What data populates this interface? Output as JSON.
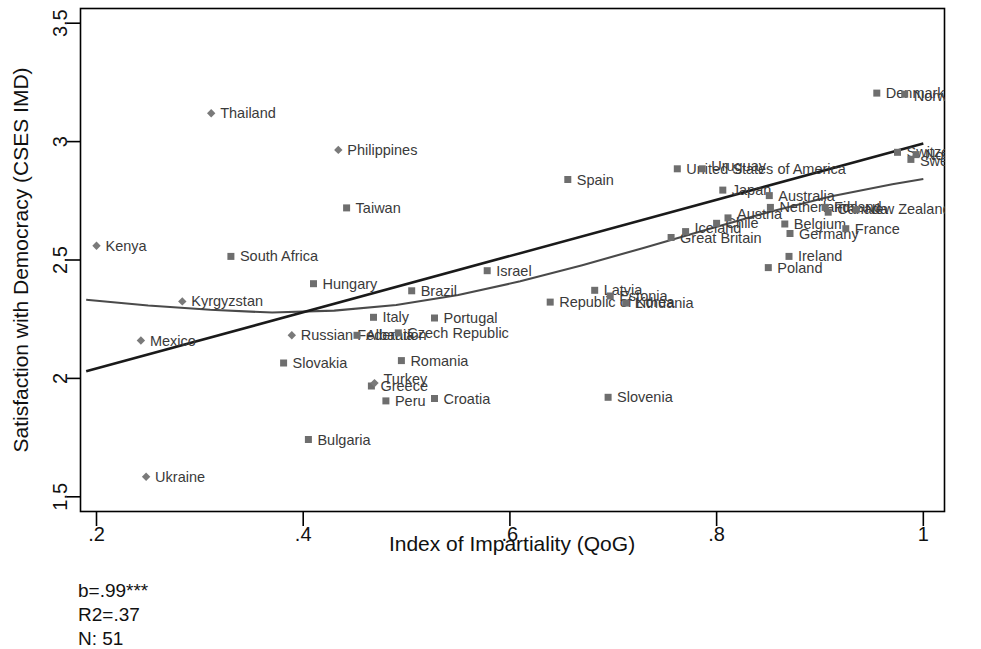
{
  "chart_data": {
    "type": "scatter",
    "title": "",
    "xlabel": "Index of Impartiality (QoG)",
    "ylabel": "Satisfaction with Democracy (CSES IMD)",
    "xlim": [
      0.185,
      1.02
    ],
    "ylim": [
      1.44,
      3.56
    ],
    "xticks": [
      0.2,
      0.4,
      0.6,
      0.8,
      1.0
    ],
    "xticklabels": [
      ".2",
      ".4",
      ".6",
      ".8",
      "1"
    ],
    "yticks": [
      1.5,
      2.0,
      2.5,
      3.0,
      3.5
    ],
    "yticklabels": [
      "1.5",
      "2",
      "2.5",
      "3",
      "3.5"
    ],
    "grid": false,
    "legend": "none",
    "marker_shapes": [
      "square",
      "diamond"
    ],
    "points": [
      {
        "label": "Kenya",
        "x": 0.2,
        "y": 2.56,
        "shape": "diamond",
        "lx": 9,
        "ly": 5
      },
      {
        "label": "Ukraine",
        "x": 0.248,
        "y": 1.585,
        "shape": "diamond",
        "lx": 9,
        "ly": 5
      },
      {
        "label": "Mexico",
        "x": 0.243,
        "y": 2.16,
        "shape": "diamond",
        "lx": 9,
        "ly": 5
      },
      {
        "label": "Kyrgyzstan",
        "x": 0.283,
        "y": 2.325,
        "shape": "diamond",
        "lx": 9,
        "ly": 5
      },
      {
        "label": "South Africa",
        "x": 0.33,
        "y": 2.515,
        "shape": "square",
        "lx": 9,
        "ly": 5
      },
      {
        "label": "Thailand",
        "x": 0.311,
        "y": 3.12,
        "shape": "diamond",
        "lx": 9,
        "ly": 5
      },
      {
        "label": "Philippines",
        "x": 0.434,
        "y": 2.965,
        "shape": "diamond",
        "lx": 9,
        "ly": 5
      },
      {
        "label": "Slovakia",
        "x": 0.381,
        "y": 2.065,
        "shape": "square",
        "lx": 9,
        "ly": 5
      },
      {
        "label": "Russian Federation",
        "x": 0.389,
        "y": 2.182,
        "shape": "diamond",
        "lx": 9,
        "ly": 5
      },
      {
        "label": "Bulgaria",
        "x": 0.405,
        "y": 1.742,
        "shape": "square",
        "lx": 9,
        "ly": 5
      },
      {
        "label": "Hungary",
        "x": 0.41,
        "y": 2.4,
        "shape": "square",
        "lx": 9,
        "ly": 5
      },
      {
        "label": "Albania",
        "x": 0.452,
        "y": 2.182,
        "shape": "square",
        "lx": 9,
        "ly": 5
      },
      {
        "label": "Greece",
        "x": 0.466,
        "y": 1.968,
        "shape": "square",
        "lx": 9,
        "ly": 5
      },
      {
        "label": "Turkey",
        "x": 0.469,
        "y": 1.98,
        "shape": "diamond",
        "lx": 9,
        "ly": 1
      },
      {
        "label": "Taiwan",
        "x": 0.442,
        "y": 2.72,
        "shape": "square",
        "lx": 9,
        "ly": 5
      },
      {
        "label": "Peru",
        "x": 0.48,
        "y": 1.905,
        "shape": "square",
        "lx": 9,
        "ly": 5
      },
      {
        "label": "Italy",
        "x": 0.468,
        "y": 2.258,
        "shape": "square",
        "lx": 9,
        "ly": 5
      },
      {
        "label": "Brazil",
        "x": 0.505,
        "y": 2.37,
        "shape": "square",
        "lx": 9,
        "ly": 5
      },
      {
        "label": "Czech Republic",
        "x": 0.492,
        "y": 2.192,
        "shape": "square",
        "lx": 9,
        "ly": 5
      },
      {
        "label": "Romania",
        "x": 0.495,
        "y": 2.075,
        "shape": "square",
        "lx": 9,
        "ly": 5
      },
      {
        "label": "Portugal",
        "x": 0.527,
        "y": 2.255,
        "shape": "square",
        "lx": 9,
        "ly": 5
      },
      {
        "label": "Croatia",
        "x": 0.527,
        "y": 1.915,
        "shape": "square",
        "lx": 9,
        "ly": 5
      },
      {
        "label": "Spain",
        "x": 0.656,
        "y": 2.84,
        "shape": "square",
        "lx": 9,
        "ly": 5
      },
      {
        "label": "Israel",
        "x": 0.578,
        "y": 2.455,
        "shape": "square",
        "lx": 9,
        "ly": 5
      },
      {
        "label": "Slovenia",
        "x": 0.695,
        "y": 1.92,
        "shape": "square",
        "lx": 9,
        "ly": 5
      },
      {
        "label": "Republic of Korea",
        "x": 0.639,
        "y": 2.322,
        "shape": "square",
        "lx": 9,
        "ly": 5
      },
      {
        "label": "Latvia",
        "x": 0.682,
        "y": 2.372,
        "shape": "square",
        "lx": 9,
        "ly": 5
      },
      {
        "label": "Estonia",
        "x": 0.697,
        "y": 2.348,
        "shape": "square",
        "lx": 9,
        "ly": 5
      },
      {
        "label": "Lithuania",
        "x": 0.712,
        "y": 2.318,
        "shape": "square",
        "lx": 9,
        "ly": 5
      },
      {
        "label": "Great Britain",
        "x": 0.756,
        "y": 2.595,
        "shape": "square",
        "lx": 9,
        "ly": 5
      },
      {
        "label": "Iceland",
        "x": 0.77,
        "y": 2.62,
        "shape": "square",
        "lx": 9,
        "ly": 1
      },
      {
        "label": "United States of America",
        "x": 0.762,
        "y": 2.885,
        "shape": "square",
        "lx": 9,
        "ly": 5
      },
      {
        "label": "Uruguay",
        "x": 0.786,
        "y": 2.885,
        "shape": "square",
        "lx": 9,
        "ly": 2
      },
      {
        "label": "Japan",
        "x": 0.806,
        "y": 2.795,
        "shape": "square",
        "lx": 9,
        "ly": 5
      },
      {
        "label": "Chile",
        "x": 0.8,
        "y": 2.655,
        "shape": "square",
        "lx": 9,
        "ly": 5
      },
      {
        "label": "Austria",
        "x": 0.811,
        "y": 2.678,
        "shape": "square",
        "lx": 9,
        "ly": 1
      },
      {
        "label": "Poland",
        "x": 0.85,
        "y": 2.468,
        "shape": "square",
        "lx": 9,
        "ly": 5
      },
      {
        "label": "Ireland",
        "x": 0.87,
        "y": 2.515,
        "shape": "square",
        "lx": 9,
        "ly": 5
      },
      {
        "label": "Australia",
        "x": 0.851,
        "y": 2.772,
        "shape": "square",
        "lx": 9,
        "ly": 5
      },
      {
        "label": "Netherlands",
        "x": 0.852,
        "y": 2.722,
        "shape": "square",
        "lx": 9,
        "ly": 5
      },
      {
        "label": "Belgium",
        "x": 0.866,
        "y": 2.652,
        "shape": "square",
        "lx": 9,
        "ly": 5
      },
      {
        "label": "Germany",
        "x": 0.871,
        "y": 2.612,
        "shape": "square",
        "lx": 9,
        "ly": 5
      },
      {
        "label": "Finland",
        "x": 0.905,
        "y": 2.722,
        "shape": "square",
        "lx": 9,
        "ly": 5
      },
      {
        "label": "Canada",
        "x": 0.908,
        "y": 2.702,
        "shape": "square",
        "lx": 9,
        "ly": 2
      },
      {
        "label": "France",
        "x": 0.925,
        "y": 2.632,
        "shape": "square",
        "lx": 0,
        "ly": 5
      },
      {
        "label": "New Zealand",
        "x": 0.935,
        "y": 2.712,
        "shape": "square",
        "lx": 9,
        "ly": 4
      },
      {
        "label": "Denmark",
        "x": 0.955,
        "y": 3.205,
        "shape": "square",
        "lx": 9,
        "ly": 5
      },
      {
        "label": "Norway",
        "x": 0.982,
        "y": 3.2,
        "shape": "square",
        "lx": 9,
        "ly": 7
      },
      {
        "label": "Switzerland",
        "x": 0.975,
        "y": 2.955,
        "shape": "square",
        "lx": 9,
        "ly": 5
      },
      {
        "label": "Sweden",
        "x": 0.988,
        "y": 2.925,
        "shape": "square",
        "lx": 9,
        "ly": 7
      },
      {
        "label": "Norway2",
        "x": 0.993,
        "y": 2.945,
        "shape": "square",
        "lx": 9,
        "ly": 5
      }
    ],
    "fit_linear": {
      "name": "linear fit",
      "x": [
        0.19,
        1.0
      ],
      "y": [
        2.03,
        2.992
      ],
      "color": "#1a1a1a"
    },
    "fit_smooth": {
      "name": "quadratic / lowess fit",
      "x": [
        0.19,
        0.25,
        0.31,
        0.37,
        0.43,
        0.49,
        0.55,
        0.61,
        0.67,
        0.73,
        0.79,
        0.85,
        0.91,
        0.97,
        1.0
      ],
      "y": [
        2.332,
        2.308,
        2.29,
        2.278,
        2.286,
        2.31,
        2.352,
        2.41,
        2.478,
        2.552,
        2.628,
        2.702,
        2.768,
        2.82,
        2.842
      ],
      "color": "#4a4a4a"
    }
  },
  "stats": {
    "coefficient": "b=.99***",
    "r_squared": "R2=.37",
    "n": "N: 51"
  }
}
